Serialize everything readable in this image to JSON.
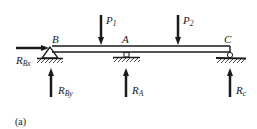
{
  "diagram": {
    "caption": "(a)",
    "points": {
      "B": "B",
      "A": "A",
      "C": "C"
    },
    "loads": [
      {
        "name": "P",
        "sub": "1"
      },
      {
        "name": "P",
        "sub": "2"
      }
    ],
    "reactions": {
      "RBx": {
        "name": "R",
        "sub": "Bx"
      },
      "RBy": {
        "name": "R",
        "sub": "By"
      },
      "RA": {
        "name": "R",
        "sub": "A"
      },
      "RC": {
        "name": "R",
        "sub": "c"
      }
    },
    "colors": {
      "ink": "#1a1a1a",
      "background": "#ffffff"
    }
  }
}
